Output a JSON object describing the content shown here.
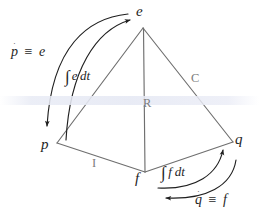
{
  "figure": {
    "name": "tetrahedron-of-state",
    "background_color": "#ffffff",
    "line_color": "#6b6b6b",
    "arrow_color": "#1f1f1f",
    "text_color": "#1f1f1f",
    "faint_label_color": "#7d7d7d"
  },
  "vertices": [
    {
      "id": "e",
      "label": "e",
      "x": 143,
      "y": 28,
      "label_x": 137,
      "label_y": 6
    },
    {
      "id": "p",
      "label": "p",
      "x": 57,
      "y": 143,
      "label_x": 42,
      "label_y": 138
    },
    {
      "id": "q",
      "label": "q",
      "x": 233,
      "y": 142,
      "label_x": 236,
      "label_y": 133
    },
    {
      "id": "f",
      "label": "f",
      "x": 145,
      "y": 172,
      "label_x": 136,
      "label_y": 170
    }
  ],
  "edges": [
    {
      "id": "p-e",
      "from": "p",
      "to": "e",
      "label": ""
    },
    {
      "id": "e-q",
      "from": "e",
      "to": "q",
      "label": "C"
    },
    {
      "id": "e-f",
      "from": "e",
      "to": "f",
      "label": "R"
    },
    {
      "id": "p-f",
      "from": "p",
      "to": "f",
      "label": "I"
    },
    {
      "id": "f-q",
      "from": "f",
      "to": "q",
      "label": ""
    }
  ],
  "edge_labels": [
    {
      "id": "label-R",
      "text": "R",
      "x": 144,
      "y": 98,
      "tone": "faint"
    },
    {
      "id": "label-C",
      "text": "C",
      "x": 192,
      "y": 73,
      "tone": "faint"
    },
    {
      "id": "label-I",
      "text": "I",
      "x": 92,
      "y": 158,
      "tone": "faint"
    }
  ],
  "relations": [
    {
      "id": "p-dot-equals-e",
      "variable": "p",
      "dot": "˙",
      "operator": "≡",
      "value": "e",
      "x": 12,
      "y": 46,
      "arrow": {
        "from": "e",
        "to": "p",
        "direction": "down-left"
      }
    },
    {
      "id": "integral-e-dt",
      "integral": "∫",
      "integrand": "e",
      "differential": "dt",
      "x": 66,
      "y": 70,
      "arrow": {
        "from": "p",
        "to": "e",
        "direction": "up-right"
      }
    },
    {
      "id": "integral-f-dt",
      "integral": "∫",
      "integrand": "f",
      "differential": "dt",
      "x": 162,
      "y": 166,
      "arrow": {
        "from": "f",
        "to": "q",
        "direction": "up-right"
      }
    },
    {
      "id": "q-dot-equals-f",
      "variable": "q",
      "dot": "˙",
      "operator": "≡",
      "value": "f",
      "x": 196,
      "y": 194,
      "arrow": {
        "from": "q",
        "to": "f",
        "direction": "down-left"
      }
    }
  ],
  "glyphs": {
    "integral_sign": "∫",
    "identical_to": "≡",
    "dot_accent": "˙",
    "dt": "dt"
  }
}
